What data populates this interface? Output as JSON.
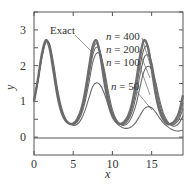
{
  "chart_data": {
    "type": "line",
    "title": "",
    "xlabel": "x",
    "ylabel": "y",
    "xlim": [
      0,
      19
    ],
    "ylim": [
      -0.5,
      3.5
    ],
    "xticks": [
      0,
      5,
      10,
      15
    ],
    "yticks": [
      0,
      1,
      2,
      3
    ],
    "grid": false,
    "legend": "inline annotations",
    "x": [
      0,
      0.5,
      1,
      1.5,
      2,
      2.5,
      3,
      3.5,
      4,
      4.5,
      5,
      5.5,
      6,
      6.5,
      7,
      7.5,
      8,
      8.5,
      9,
      9.5,
      10,
      10.5,
      11,
      11.5,
      12,
      12.5,
      13,
      13.5,
      14,
      14.5,
      15,
      15.5,
      16,
      16.5,
      17,
      17.5,
      18,
      18.5,
      19
    ],
    "series": [
      {
        "name": "Exact",
        "values": [
          1.0,
          1.62,
          2.32,
          2.71,
          2.48,
          1.82,
          1.15,
          0.7,
          0.47,
          0.38,
          0.38,
          0.5,
          0.76,
          1.24,
          1.93,
          2.55,
          2.69,
          2.22,
          1.51,
          0.93,
          0.58,
          0.42,
          0.37,
          0.43,
          0.59,
          0.94,
          1.52,
          2.23,
          2.7,
          2.54,
          1.91,
          1.22,
          0.74,
          0.49,
          0.37,
          0.38,
          0.47,
          0.69,
          1.17
        ]
      },
      {
        "name": "n = 400",
        "values": [
          1.0,
          1.61,
          2.3,
          2.7,
          2.5,
          1.86,
          1.18,
          0.72,
          0.47,
          0.38,
          0.37,
          0.47,
          0.71,
          1.15,
          1.8,
          2.42,
          2.62,
          2.32,
          1.66,
          1.04,
          0.64,
          0.44,
          0.36,
          0.39,
          0.52,
          0.81,
          1.3,
          1.95,
          2.45,
          2.52,
          2.05,
          1.38,
          0.85,
          0.54,
          0.39,
          0.35,
          0.41,
          0.58,
          0.96
        ]
      },
      {
        "name": "n = 200",
        "values": [
          1.0,
          1.6,
          2.29,
          2.69,
          2.52,
          1.9,
          1.21,
          0.74,
          0.48,
          0.38,
          0.36,
          0.45,
          0.67,
          1.08,
          1.69,
          2.3,
          2.52,
          2.34,
          1.76,
          1.13,
          0.69,
          0.46,
          0.36,
          0.36,
          0.47,
          0.71,
          1.13,
          1.72,
          2.2,
          2.3,
          2.1,
          1.52,
          0.96,
          0.6,
          0.42,
          0.34,
          0.37,
          0.5,
          0.8
        ]
      },
      {
        "name": "n = 100",
        "values": [
          1.0,
          1.58,
          2.26,
          2.68,
          2.55,
          1.96,
          1.27,
          0.77,
          0.5,
          0.38,
          0.35,
          0.42,
          0.61,
          0.97,
          1.52,
          2.1,
          2.35,
          2.28,
          1.86,
          1.25,
          0.76,
          0.49,
          0.36,
          0.33,
          0.4,
          0.58,
          0.9,
          1.38,
          1.82,
          1.98,
          1.9,
          1.55,
          1.06,
          0.67,
          0.45,
          0.33,
          0.31,
          0.39,
          0.6
        ]
      },
      {
        "name": "n = 50",
        "values": [
          1.0,
          1.55,
          2.2,
          2.65,
          2.6,
          2.06,
          1.36,
          0.84,
          0.53,
          0.39,
          0.33,
          0.36,
          0.49,
          0.74,
          1.09,
          1.42,
          1.52,
          1.44,
          1.2,
          0.88,
          0.6,
          0.4,
          0.3,
          0.25,
          0.25,
          0.3,
          0.42,
          0.6,
          0.78,
          0.85,
          0.82,
          0.7,
          0.54,
          0.4,
          0.3,
          0.22,
          0.18,
          0.17,
          0.2
        ]
      }
    ],
    "annotations": [
      {
        "text": "Exact",
        "x": 4.2,
        "y": 2.87
      },
      {
        "text": "n = 400",
        "x": 9.6,
        "y": 2.72
      },
      {
        "text": "n = 200",
        "x": 9.6,
        "y": 2.35
      },
      {
        "text": "n = 100",
        "x": 9.6,
        "y": 1.98
      },
      {
        "text": "n = 50",
        "x": 9.8,
        "y": 1.27
      }
    ]
  },
  "labels": {
    "xlabel": "x",
    "ylabel": "y",
    "exact": "Exact",
    "n400": "n = 400",
    "n200": "n = 200",
    "n100": "n = 100",
    "n50": "n = 50"
  }
}
